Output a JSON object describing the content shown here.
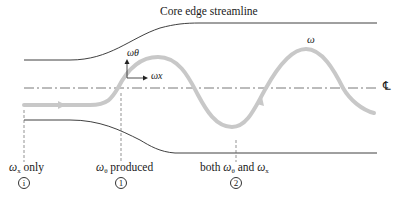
{
  "diagram": {
    "title": "Core edge streamline",
    "axis_labels": {
      "omega_theta": "ωθ",
      "omega_x": "ωx",
      "omega_vector": "ω⃗",
      "centerline": "℄"
    },
    "stations": [
      {
        "label_sym": "ω",
        "label_sub": "x",
        "label_rest": " only",
        "marker": "i"
      },
      {
        "label_sym": "ω",
        "label_sub": "θ",
        "label_rest": " produced",
        "marker": "1"
      },
      {
        "label_prefix": "both ",
        "label_sym": "ω",
        "label_sub": "θ",
        "label_mid": " and ",
        "label_sym2": "ω",
        "label_sub2": "x",
        "marker": "2"
      }
    ],
    "colors": {
      "line": "#2a2a2a",
      "vortex_path": "#c8c8c8",
      "centerline": "#555555",
      "dashed": "#666666"
    }
  }
}
